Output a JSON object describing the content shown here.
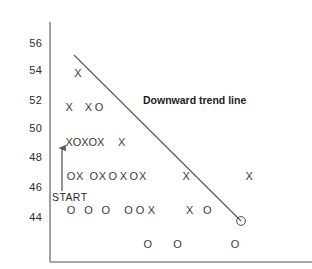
{
  "chart_data": {
    "type": "scatter",
    "title": "",
    "xlabel": "",
    "ylabel": "",
    "grid": false,
    "legend_position": "none",
    "yticks": [
      56,
      54,
      52,
      50,
      48,
      46,
      44
    ],
    "ylim": [
      43,
      57
    ],
    "xlim": [
      0,
      30
    ],
    "marker_glyphs": {
      "x": "X",
      "o": "O"
    },
    "annotations": [
      {
        "name": "trend-line-label",
        "text": "Downward trend line",
        "x": 13.2,
        "y": 52.2
      },
      {
        "name": "start-label",
        "text": "START",
        "x": 1.1,
        "y": 44.9
      }
    ],
    "trend_line": {
      "name": "downward-trend-line",
      "label": "Downward trend line",
      "x1": 2.6,
      "y1": 54.9,
      "x2": 21.2,
      "y2": 44.0
    },
    "start_arrow": {
      "name": "start-arrow",
      "x": 1.4,
      "y_from": 45.4,
      "y_to": 48.4
    },
    "highlighted_point": {
      "x": 21.2,
      "y": 44.0,
      "marker": "o",
      "note": "circled endpoint of trend line"
    },
    "series": [
      {
        "name": "X marks",
        "marker": "x",
        "points": [
          {
            "x": 3.2,
            "y": 54
          },
          {
            "x": 2.2,
            "y": 52
          },
          {
            "x": 4.4,
            "y": 52
          },
          {
            "x": 2.2,
            "y": 50
          },
          {
            "x": 4.0,
            "y": 50
          },
          {
            "x": 5.8,
            "y": 50
          },
          {
            "x": 8.2,
            "y": 50
          },
          {
            "x": 3.4,
            "y": 48
          },
          {
            "x": 6.0,
            "y": 48
          },
          {
            "x": 8.4,
            "y": 48
          },
          {
            "x": 10.6,
            "y": 48
          },
          {
            "x": 15.6,
            "y": 48
          },
          {
            "x": 22.8,
            "y": 48
          },
          {
            "x": 11.6,
            "y": 46
          },
          {
            "x": 16.0,
            "y": 46
          }
        ]
      },
      {
        "name": "O marks",
        "marker": "o",
        "points": [
          {
            "x": 5.6,
            "y": 52
          },
          {
            "x": 3.1,
            "y": 50
          },
          {
            "x": 4.9,
            "y": 50
          },
          {
            "x": 2.4,
            "y": 48
          },
          {
            "x": 5.0,
            "y": 48
          },
          {
            "x": 7.2,
            "y": 48
          },
          {
            "x": 9.6,
            "y": 48
          },
          {
            "x": 2.4,
            "y": 46
          },
          {
            "x": 4.4,
            "y": 46
          },
          {
            "x": 6.4,
            "y": 46
          },
          {
            "x": 9.0,
            "y": 46
          },
          {
            "x": 10.3,
            "y": 46
          },
          {
            "x": 18.0,
            "y": 46
          },
          {
            "x": 11.2,
            "y": 44
          },
          {
            "x": 14.6,
            "y": 44
          },
          {
            "x": 21.2,
            "y": 44
          }
        ]
      }
    ]
  },
  "axis": {
    "y_axis_name": "y-axis",
    "x_axis_name": "x-axis",
    "tick_labels": [
      "56",
      "54",
      "52",
      "50",
      "48",
      "46",
      "44"
    ]
  },
  "labels": {
    "trend": "Downward trend line",
    "start": "START"
  },
  "colors": {
    "axis": "#8a8a8a",
    "marker": "#3a3a3a",
    "text": "#2b2b2b",
    "annotation": "#1d1d1d",
    "trend_line": "#555555",
    "background": "#ffffff"
  }
}
